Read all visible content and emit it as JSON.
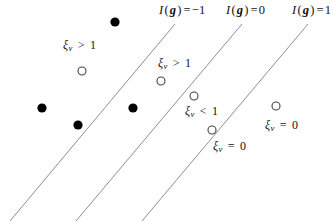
{
  "figure": {
    "width": 333,
    "height": 221,
    "background": "#ffffff",
    "line_color": "#808080",
    "filled_point_color": "#000000",
    "open_point_stroke": "#444444"
  },
  "boundary_labels": [
    {
      "id": "label-margin-minus-one",
      "text": "I(g) = −1",
      "func": "I",
      "arg": "g",
      "value": "−1",
      "x": 159,
      "y": 3
    },
    {
      "id": "label-decision-zero",
      "text": "I(g) = 0",
      "func": "I",
      "arg": "g",
      "value": "0",
      "x": 226,
      "y": 3
    },
    {
      "id": "label-margin-plus-one",
      "text": "I(g) = 1",
      "func": "I",
      "arg": "g",
      "value": "1",
      "x": 292,
      "y": 3
    }
  ],
  "boundary_lines": [
    {
      "id": "line-margin-minus-one",
      "x1": 175,
      "y1": 24,
      "x2": 10,
      "y2": 221
    },
    {
      "id": "line-decision-zero",
      "x1": 242,
      "y1": 24,
      "x2": 76,
      "y2": 221
    },
    {
      "id": "line-margin-plus-one",
      "x1": 308,
      "y1": 24,
      "x2": 142,
      "y2": 221
    }
  ],
  "filled_points": [
    {
      "id": "filled-point-1",
      "cx": 115,
      "cy": 22,
      "r": 4.6
    },
    {
      "id": "filled-point-2",
      "cx": 42,
      "cy": 108,
      "r": 4.6
    },
    {
      "id": "filled-point-3",
      "cx": 78,
      "cy": 125,
      "r": 4.6
    },
    {
      "id": "filled-point-4",
      "cx": 133,
      "cy": 108,
      "r": 4.6
    }
  ],
  "open_points": [
    {
      "id": "open-point-1",
      "cx": 82,
      "cy": 71,
      "r": 4.0
    },
    {
      "id": "open-point-2",
      "cx": 161,
      "cy": 81,
      "r": 4.0
    },
    {
      "id": "open-point-3",
      "cx": 194,
      "cy": 96,
      "r": 4.0
    },
    {
      "id": "open-point-4",
      "cx": 212,
      "cy": 130,
      "r": 4.0
    },
    {
      "id": "open-point-5",
      "cx": 276,
      "cy": 106,
      "r": 4.0
    }
  ],
  "slack_labels": [
    {
      "id": "slack-label-1",
      "text": "ξν > 1",
      "symbol": "ξ",
      "sub": "ν",
      "relation": ">",
      "value": "1",
      "x": 63,
      "y": 38
    },
    {
      "id": "slack-label-2",
      "text": "ξν > 1",
      "symbol": "ξ",
      "sub": "ν",
      "relation": ">",
      "value": "1",
      "x": 158,
      "y": 56
    },
    {
      "id": "slack-label-3",
      "text": "ξν < 1",
      "symbol": "ξ",
      "sub": "ν",
      "relation": "<",
      "value": "1",
      "x": 185,
      "y": 104
    },
    {
      "id": "slack-label-4",
      "text": "ξν = 0",
      "symbol": "ξ",
      "sub": "ν",
      "relation": "=",
      "value": "0",
      "x": 213,
      "y": 139
    },
    {
      "id": "slack-label-5",
      "text": "ξν = 0",
      "symbol": "ξ",
      "sub": "ν",
      "relation": "=",
      "value": "0",
      "x": 265,
      "y": 118
    }
  ]
}
